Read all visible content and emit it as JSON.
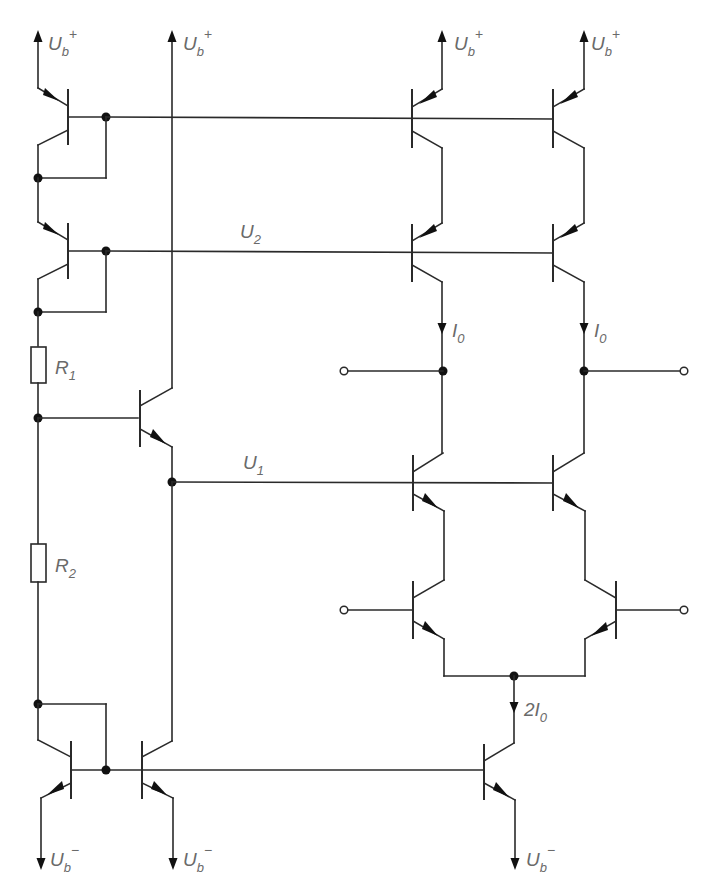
{
  "diagram": {
    "type": "circuit-schematic",
    "colors": {
      "line": "#2a2a2a",
      "label": "#6a6a6a",
      "background": "#ffffff"
    },
    "labels": {
      "supply_pos": {
        "main": "U",
        "sub": "b",
        "sup": "+"
      },
      "supply_neg": {
        "main": "U",
        "sub": "b",
        "sup": "−"
      },
      "u2": {
        "main": "U",
        "sub": "2"
      },
      "u1": {
        "main": "U",
        "sub": "1"
      },
      "r1": {
        "main": "R",
        "sub": "1"
      },
      "r2": {
        "main": "R",
        "sub": "2"
      },
      "i0_left": {
        "main": "I",
        "sub": "0"
      },
      "i0_right": {
        "main": "I",
        "sub": "0"
      },
      "tail_current": {
        "prefix": "2",
        "main": "I",
        "sub": "0"
      }
    },
    "components": {
      "transistors": [
        {
          "id": "T_top_left",
          "type": "pnp",
          "role": "diode-connected bias"
        },
        {
          "id": "T_mid_left",
          "type": "pnp",
          "role": "diode-connected bias"
        },
        {
          "id": "T_top_right_a",
          "type": "pnp",
          "role": "current source"
        },
        {
          "id": "T_top_right_b",
          "type": "pnp",
          "role": "current source"
        },
        {
          "id": "T_cascode_pnp_a",
          "type": "pnp",
          "role": "cascode"
        },
        {
          "id": "T_cascode_pnp_b",
          "type": "pnp",
          "role": "cascode"
        },
        {
          "id": "T_follower",
          "type": "npn",
          "role": "emitter follower"
        },
        {
          "id": "T_cascode_npn_a",
          "type": "npn",
          "role": "cascode"
        },
        {
          "id": "T_cascode_npn_b",
          "type": "npn",
          "role": "cascode"
        },
        {
          "id": "T_diff_a",
          "type": "npn",
          "role": "differential pair"
        },
        {
          "id": "T_diff_b",
          "type": "npn",
          "role": "differential pair"
        },
        {
          "id": "T_bot_left",
          "type": "npn",
          "role": "diode-connected mirror"
        },
        {
          "id": "T_bot_mid",
          "type": "npn",
          "role": "mirror"
        },
        {
          "id": "T_tail",
          "type": "npn",
          "role": "tail current source"
        }
      ],
      "resistors": [
        "R1",
        "R2"
      ],
      "terminals": [
        "input_left",
        "input_right",
        "output_left",
        "output_right"
      ]
    }
  }
}
